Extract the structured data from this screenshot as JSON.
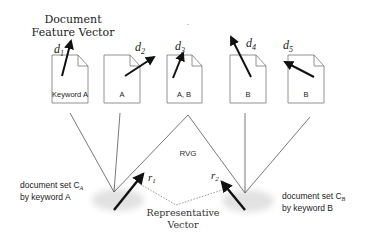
{
  "title": {
    "line1": "Document",
    "line2": "Feature Vector"
  },
  "documents": [
    {
      "id": "d1",
      "label_main": "d",
      "label_sub": "1",
      "keyword": "Keyword A"
    },
    {
      "id": "d2",
      "label_main": "d",
      "label_sub": "2",
      "keyword": "A"
    },
    {
      "id": "d3",
      "label_main": "d",
      "label_sub": "3",
      "keyword": "A, B"
    },
    {
      "id": "d4",
      "label_main": "d",
      "label_sub": "4",
      "keyword": "B"
    },
    {
      "id": "d5",
      "label_main": "d",
      "label_sub": "5",
      "keyword": "B"
    }
  ],
  "graph_label": "RVG",
  "clusters": {
    "a": {
      "line1": "document set C",
      "sub": "A",
      "line2": "by keyword A",
      "vector_main": "r",
      "vector_sub": "1"
    },
    "b": {
      "line1": "document set C",
      "sub": "B",
      "line2": "by keyword B",
      "vector_main": "r",
      "vector_sub": "2"
    }
  },
  "representative": {
    "line1": "Representative",
    "line2": "Vector"
  },
  "colors": {
    "line": "#555555",
    "arrow": "#111111",
    "cloud": "#e4e4e4",
    "text": "#222222"
  }
}
